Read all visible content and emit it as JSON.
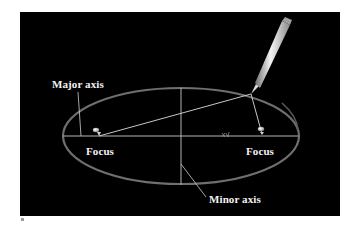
{
  "figure": {
    "background": "#000000",
    "stroke_color": "#b8b8b8",
    "ellipse_color": "#7a7a7a",
    "labels": {
      "major_axis": "Major axis",
      "focus_left": "Focus",
      "focus_right": "Focus",
      "minor_axis": "Minor axis"
    },
    "ellipse": {
      "cx": 181,
      "cy": 136,
      "rx": 118,
      "ry": 48
    },
    "foci": [
      {
        "x": 98,
        "y": 135
      },
      {
        "x": 262,
        "y": 135
      }
    ],
    "pencil_tip": {
      "x": 251,
      "y": 94
    }
  }
}
